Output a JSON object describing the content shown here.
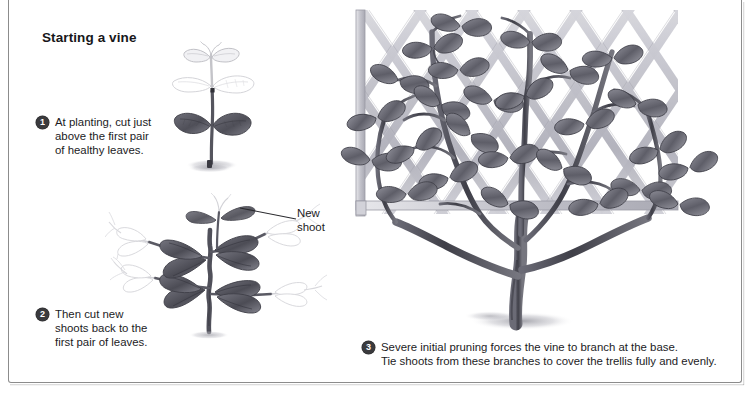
{
  "panel": {
    "title": "Starting a vine",
    "background_color": "#ffffff",
    "border_color": "#8c8c8c"
  },
  "steps": [
    {
      "number": "1",
      "text": "At planting, cut just\nabove the first pair\nof healthy leaves."
    },
    {
      "number": "2",
      "text": "Then cut new\nshoots back to the\nfirst pair of leaves."
    },
    {
      "number": "3",
      "text": "Severe initial pruning forces the vine to branch at the base.\nTie shoots from these branches to cover the trellis fully and evenly."
    }
  ],
  "callouts": [
    {
      "label": "New\nshoot",
      "target": "new-shoot-on-pruned-plant"
    }
  ],
  "illustrations": [
    {
      "name": "seedling-with-cut-marked",
      "description": "Young vine seedling: one dark pair of healthy lower leaves, ghosted upper growth above the cut line",
      "style": "graphite pencil drawing"
    },
    {
      "name": "pruned-plant-with-new-shoots",
      "description": "Pruned vine with four branches; dark new leaves near the stem, ghosted outlines showing growth to be removed",
      "style": "graphite pencil drawing"
    },
    {
      "name": "vine-on-diamond-lattice-trellis",
      "description": "Mature vine branching at the base, trained over a diamond lattice trellis panel",
      "style": "graphite pencil drawing"
    }
  ],
  "colors": {
    "ink": "#1b1b1e",
    "bullet_fill": "#3a3a3d",
    "bullet_text": "#ffffff",
    "graphite_dark": "#4a4a52",
    "graphite_mid": "#8a8a93",
    "graphite_light": "#c3c3ca",
    "ghost": "#d3d3d9",
    "lattice": "#bdbdc4",
    "shadow": "#c9c9cf"
  }
}
